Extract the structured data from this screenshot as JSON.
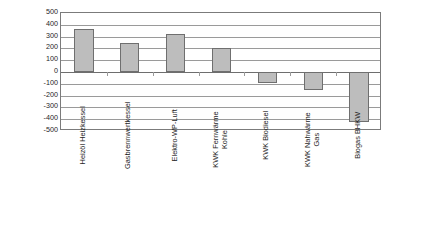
{
  "chart_data": {
    "type": "bar",
    "title": "",
    "subtitle": "",
    "xlabel": "",
    "ylabel": "CO2-Äquivalent in g / kWh",
    "ylabel_parts": {
      "prefix": "CO",
      "sub": "2",
      "suffix": "-Äquivalent in g / kWh"
    },
    "categories": [
      "Heizöl Heizkessel",
      "Gasbrennwertkessel",
      "Elektro-WP-Luft",
      "KWK Fernwärme\nKohle",
      "KWK Biodiesel",
      "KWK Nahwärme\nGas",
      "Biogas BHKW"
    ],
    "values": [
      365,
      248,
      325,
      207,
      -95,
      -155,
      -420
    ],
    "ylim": [
      -500,
      500
    ],
    "ytick_step": 100,
    "yticks": [
      500,
      400,
      300,
      200,
      100,
      0,
      -100,
      -200,
      -300,
      -400,
      -500
    ],
    "ytick_labels": [
      "500",
      "400",
      "300",
      "200",
      "100",
      "0",
      "-100",
      "-200",
      "-300",
      "-400",
      "-500"
    ],
    "grid": true,
    "legend": false,
    "legend_position": "none",
    "bar_fill_color": "#bdbdbd",
    "bar_border_color": "#6f6f6f",
    "gridline_color": "#9a9a9a",
    "axis_color": "#7b7b7b",
    "text_color": "#1f1f1f",
    "background_color": "#ffffff"
  }
}
